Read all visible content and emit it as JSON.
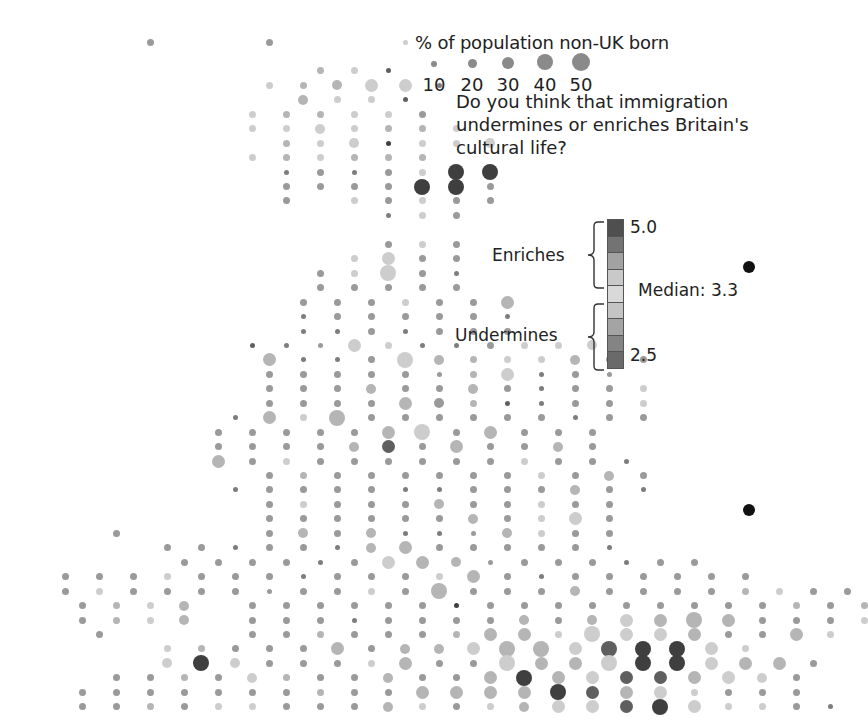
{
  "chart_data": {
    "type": "scatter",
    "subtype": "dot-grid-map",
    "title": "% of population non-UK born",
    "size_legend": {
      "title": "% of population non-UK born",
      "values": [
        10,
        20,
        30,
        40,
        50
      ]
    },
    "color_legend": {
      "question": "Do you think that immigration undermines or enriches Britain's cultural life?",
      "max_label": "5.0",
      "min_label": "2.5",
      "median_label": "Median: 3.3",
      "group_high": "Enriches",
      "group_low": "Undermines",
      "steps": [
        "#4f4f4f",
        "#737373",
        "#a2a2a2",
        "#c9c9c9",
        "#d9d9d9",
        "#c4c4c4",
        "#a4a4a4",
        "#848484",
        "#6a6a6a"
      ]
    },
    "grid": {
      "x0": 48,
      "dx": 17,
      "y0": 42,
      "dy": 14.45
    },
    "tones": {
      "1": "#3f3f3f",
      "2": "#5f5f5f",
      "3": "#7d7d7d",
      "4": "#9a9a9a",
      "5": "#b5b5b5",
      "6": "#cdcdcd",
      "7": "#dadada"
    },
    "sizes": {
      "1": 5,
      "2": 7,
      "3": 10,
      "4": 13,
      "5": 16
    },
    "rows": [
      "            24            24              16",
      "",
      "                                25  26  12",
      "                          26  25  35  46  46  13",
      "                              35  26  26  12",
      "                        26  25  25  26  26  24",
      "                        26  26  36  26  25  25  26",
      "                            25  26  36  11  26  26  36",
      "                        26  25  26  25  25  25",
      "                            13  24  13  24  26  51  51",
      "                            24  24  24  24  51  51  24",
      "                            24      26  24  26  24  24",
      "                                        13  26  24",
      "",
      "                                        24  26  24",
      "                                    26  46  24  24",
      "                                24  26  56  24  13",
      "                                24  24  24  24  24",
      "                              24  24  24  26  24  24  45",
      "                              13  24  24  24  24  24  13",
      "                              13  13  24  13  24  24  24",
      "                        12  13  14  46  26  13  13  24  26  26  36",
      "                          45  13  13  24  56  35  25  26  26  35  24  24",
      "                          24  24  24  24  24  14  25  46  13  24  14",
      "                          24  24  24  35  24  24  35  24  13  24  24  26",
      "                          24  24  24  24  45  34  25  12  13  24  24  26",
      "                      13  45  26  55  24  24  24  24  24  24  13  24  24",
      "                    24  24  24  24  24  45  56  24  45  24  24  24",
      "                    24  24  24  24  35  42  24  45  24  24  35  24",
      "                    45  24  26  24  24  24  24  24  24  26  24  24  13",
      "                          24  25  24  24  24  24  24  24  26  24  35  24",
      "                      13  24  24  24  24  13  13  24  24  24  35  24  13",
      "                          24  26  24  24  24  35  24  24  26  24  24",
      "                          24  24  24  24  24  24  35  24  26  46  24",
      "        24                24  35  24  35  13  13  14  35  26  24  24",
      "              24  24  13  24  24  13  35  45  24  24  24  24  24  13",
      "                24  24  24  24  13  24  46  45  35  14  24  24  24  13  24  24",
      "  24  24  24  26  24  24  24  13  24  24  24  26  45  24  13  24  24  24  24  24  24",
      "  24  26  24  24  24  24  14  24  24  26  24  55  24  24  24  35  24  24  24  24  25  26  24  24",
      "    24  25  26  35      24  24  24  24  24  24  11  24  24  24  24  24  24  24  24  24  25  24  25",
      "    24  25  26  35      24  24  24  13  24  24  24  24  35  24  35  46  45  55  45  24  24  24  26",
      "      24                24  24  25  24  24  24  25  45  45  26  56  46  46  45  24  24  45  26",
      "              26  25  24  24  24  45  24  35  35  46  55  55  46  52  51  51  46  26",
      "              36  51  36  24  24  24  26  45  24  24  56  45  45  56  51  51  46  45  45  24",
      "        24  24  25  24  36  25  24  24  35  24  24  45  51  45  46  42  42  45  46  36  24",
      "    24  24  24  24  24  24  24  25  24  24  45  45  45  45  51  42  45  46  26  24  24  24",
      "    24  24  25  24  26  26  24  24  24  35  26  24  26  35  46  46  42  51  46  26  26  24  13"
    ],
    "bullets": [
      {
        "x": 749,
        "y": 267
      },
      {
        "x": 749,
        "y": 510
      }
    ]
  }
}
